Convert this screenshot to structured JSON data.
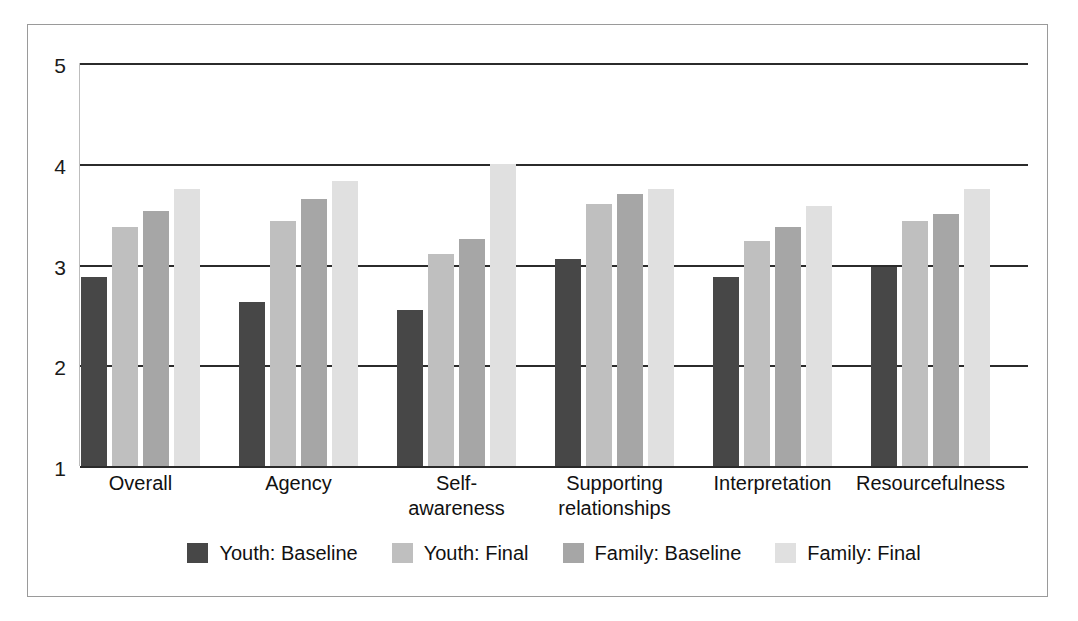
{
  "chart_data": {
    "type": "bar",
    "title": "",
    "subtitle": "",
    "xlabel": "",
    "ylabel": "",
    "ylim": [
      1,
      5
    ],
    "yticks": [
      1,
      2,
      3,
      4,
      5
    ],
    "ytick_labels": [
      "1",
      "2",
      "3",
      "4",
      "5"
    ],
    "grid": true,
    "legend_position": "bottom",
    "categories": [
      "Overall",
      "Agency",
      "Self-\nawareness",
      "Supporting\nrelationships",
      "Interpretation",
      "Resourcefulness"
    ],
    "series": [
      {
        "name": "Youth: Baseline",
        "color": "#474747",
        "values": [
          2.88,
          2.63,
          2.55,
          3.05,
          2.88,
          2.98
        ]
      },
      {
        "name": "Youth: Final",
        "color": "#bfbfbf",
        "values": [
          3.37,
          3.43,
          3.1,
          3.6,
          3.23,
          3.43
        ]
      },
      {
        "name": "Family: Baseline",
        "color": "#a6a6a6",
        "values": [
          3.53,
          3.65,
          3.25,
          3.7,
          3.37,
          3.5
        ]
      },
      {
        "name": "Family: Final",
        "color": "#e0e0e0",
        "values": [
          3.75,
          3.83,
          4.0,
          3.75,
          3.58,
          3.75
        ]
      }
    ]
  },
  "legend": {
    "items": [
      {
        "label": "Youth: Baseline",
        "swatch": "s0"
      },
      {
        "label": "Youth: Final",
        "swatch": "s1"
      },
      {
        "label": "Family: Baseline",
        "swatch": "s2"
      },
      {
        "label": "Family: Final",
        "swatch": "s3"
      }
    ]
  },
  "colors": {
    "youth_baseline": "#474747",
    "youth_final": "#bfbfbf",
    "family_baseline": "#a6a6a6",
    "family_final": "#e0e0e0",
    "gridline": "#2b2b2b",
    "frame": "#9a9a9a",
    "text": "#111111",
    "background": "#ffffff"
  }
}
